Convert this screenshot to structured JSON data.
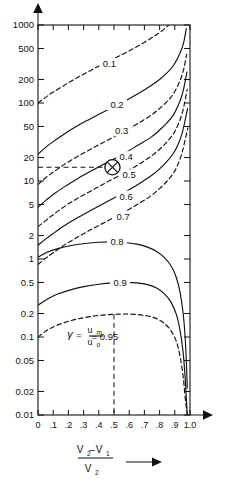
{
  "chart_data": {
    "type": "line",
    "title": "",
    "xlabel": "(V2 - V1) / V2",
    "ylabel": "",
    "xlim": [
      0,
      1.0
    ],
    "ylim": [
      0.01,
      1000
    ],
    "yscale": "log",
    "grid": false,
    "legend": "inline-curve-labels",
    "x_ticks": [
      "0",
      ".1",
      ".2",
      ".3",
      ".4",
      ".5",
      ".6",
      ".7",
      ".8",
      ".9",
      "1.0"
    ],
    "x_tick_values": [
      0,
      0.1,
      0.2,
      0.3,
      0.4,
      0.5,
      0.6,
      0.7,
      0.8,
      0.9,
      1.0
    ],
    "y_ticks": [
      "1000",
      "500",
      "200",
      "100",
      "50",
      "20",
      "10",
      "5",
      "2",
      "1",
      "0.5",
      "0.2",
      "0.1",
      "0.05",
      "0.02",
      "0.01"
    ],
    "y_tick_values": [
      1000,
      500,
      200,
      100,
      50,
      20,
      10,
      5,
      2,
      1,
      0.5,
      0.2,
      0.1,
      0.05,
      0.02,
      0.01
    ],
    "annotations": [
      {
        "name": "gamma-definition",
        "text": "= 0.95",
        "symbol": "γ",
        "numerator": "u",
        "numerator_sub": "m",
        "denominator": "u",
        "denominator_sub": "o",
        "equals": "="
      },
      {
        "name": "marker-point",
        "label": "operating-point",
        "x": 0.49,
        "y": 15,
        "on_curve": "0.4"
      },
      {
        "name": "vertical-reference",
        "x": 0.5
      }
    ],
    "series": [
      {
        "name": "0.1",
        "label": "0.1",
        "style": "dashed",
        "x": [
          0.0,
          0.05,
          0.1,
          0.18,
          0.26,
          0.34,
          0.42,
          0.5,
          0.58,
          0.66,
          0.74,
          0.8,
          0.85,
          0.89,
          0.92,
          0.945,
          0.962,
          0.972
        ],
        "values": [
          100,
          118,
          138,
          172,
          212,
          258,
          310,
          370,
          445,
          540,
          670,
          800,
          960,
          1150,
          1400,
          1750,
          2200,
          2700
        ]
      },
      {
        "name": "0.2",
        "label": "0.2",
        "style": "solid",
        "x": [
          0.0,
          0.05,
          0.1,
          0.18,
          0.26,
          0.34,
          0.42,
          0.5,
          0.58,
          0.66,
          0.74,
          0.8,
          0.85,
          0.89,
          0.92,
          0.945,
          0.962,
          0.975
        ],
        "values": [
          22,
          27,
          32,
          41,
          51,
          62,
          75,
          90,
          108,
          132,
          165,
          200,
          245,
          300,
          380,
          490,
          640,
          900
        ]
      },
      {
        "name": "0.3",
        "label": "0.3",
        "style": "dashed",
        "x": [
          0.0,
          0.05,
          0.1,
          0.18,
          0.26,
          0.34,
          0.42,
          0.5,
          0.58,
          0.66,
          0.74,
          0.8,
          0.85,
          0.89,
          0.92,
          0.945,
          0.962,
          0.978
        ],
        "values": [
          9.0,
          11.0,
          13.0,
          16.6,
          20.6,
          25.2,
          30.5,
          36.8,
          44.5,
          55,
          69,
          85,
          105,
          130,
          168,
          220,
          290,
          420
        ]
      },
      {
        "name": "0.4",
        "label": "0.4",
        "style": "solid",
        "x": [
          0.0,
          0.05,
          0.1,
          0.18,
          0.26,
          0.34,
          0.42,
          0.5,
          0.58,
          0.66,
          0.74,
          0.8,
          0.85,
          0.89,
          0.92,
          0.945,
          0.962,
          0.98
        ],
        "values": [
          4.6,
          5.6,
          6.7,
          8.6,
          10.7,
          13.1,
          15.9,
          19.2,
          23.3,
          29,
          36,
          45,
          56,
          70,
          91,
          122,
          165,
          250
        ]
      },
      {
        "name": "0.5",
        "label": "0.5",
        "style": "dashed",
        "x": [
          0.0,
          0.05,
          0.1,
          0.18,
          0.26,
          0.34,
          0.42,
          0.5,
          0.58,
          0.66,
          0.74,
          0.8,
          0.85,
          0.89,
          0.92,
          0.945,
          0.962,
          0.982
        ],
        "values": [
          2.6,
          3.1,
          3.7,
          4.8,
          6.0,
          7.3,
          8.9,
          10.8,
          13.1,
          16.2,
          20.5,
          25.5,
          32,
          40,
          52,
          70,
          95,
          150
        ]
      },
      {
        "name": "0.6",
        "label": "0.6",
        "style": "solid",
        "x": [
          0.0,
          0.05,
          0.1,
          0.18,
          0.26,
          0.34,
          0.42,
          0.5,
          0.58,
          0.66,
          0.74,
          0.8,
          0.85,
          0.89,
          0.92,
          0.945,
          0.962,
          0.984
        ],
        "values": [
          1.5,
          1.8,
          2.12,
          2.72,
          3.38,
          4.12,
          5.0,
          6.05,
          7.35,
          9.1,
          11.5,
          14.3,
          18.0,
          22.5,
          29,
          39,
          53,
          85
        ]
      },
      {
        "name": "0.7",
        "label": "0.7",
        "style": "dashed",
        "x": [
          0.0,
          0.05,
          0.1,
          0.18,
          0.26,
          0.34,
          0.42,
          0.5,
          0.58,
          0.66,
          0.74,
          0.8,
          0.85,
          0.89,
          0.92,
          0.945,
          0.962,
          0.986
        ],
        "values": [
          0.85,
          1.02,
          1.2,
          1.54,
          1.91,
          2.33,
          2.82,
          3.41,
          4.13,
          5.1,
          6.4,
          8.0,
          10.0,
          12.5,
          16.2,
          22,
          30,
          48
        ]
      },
      {
        "name": "0.8",
        "label": "0.8",
        "style": "solid",
        "x": [
          0.0,
          0.06,
          0.13,
          0.22,
          0.31,
          0.4,
          0.49,
          0.57,
          0.65,
          0.72,
          0.78,
          0.83,
          0.875,
          0.91,
          0.935,
          0.955,
          0.968,
          0.976,
          0.982
        ],
        "values": [
          1.05,
          1.22,
          1.36,
          1.49,
          1.58,
          1.64,
          1.66,
          1.63,
          1.55,
          1.42,
          1.25,
          1.05,
          0.82,
          0.58,
          0.37,
          0.2,
          0.1,
          0.048,
          0.022
        ]
      },
      {
        "name": "0.9",
        "label": "0.9",
        "style": "solid",
        "x": [
          0.0,
          0.06,
          0.13,
          0.22,
          0.31,
          0.4,
          0.49,
          0.57,
          0.65,
          0.72,
          0.78,
          0.83,
          0.875,
          0.91,
          0.935,
          0.955,
          0.968,
          0.976,
          0.982
        ],
        "values": [
          0.255,
          0.305,
          0.355,
          0.405,
          0.445,
          0.475,
          0.495,
          0.502,
          0.495,
          0.47,
          0.425,
          0.36,
          0.28,
          0.195,
          0.12,
          0.063,
          0.03,
          0.016,
          0.01
        ]
      },
      {
        "name": "0.95",
        "label": "0.95",
        "style": "dashed",
        "x": [
          0.0,
          0.06,
          0.13,
          0.22,
          0.31,
          0.4,
          0.49,
          0.57,
          0.65,
          0.72,
          0.78,
          0.83,
          0.875,
          0.91,
          0.935,
          0.955,
          0.968,
          0.976,
          0.982
        ],
        "values": [
          0.1,
          0.122,
          0.143,
          0.163,
          0.178,
          0.189,
          0.195,
          0.197,
          0.194,
          0.186,
          0.172,
          0.15,
          0.12,
          0.088,
          0.056,
          0.031,
          0.017,
          0.0125,
          0.01
        ]
      }
    ]
  },
  "axis": {
    "x_label_numerator_a": "V",
    "x_label_numerator_a_sub": "2",
    "x_label_minus": "–",
    "x_label_numerator_b": "V",
    "x_label_numerator_b_sub": "1",
    "x_label_denominator": "V",
    "x_label_denominator_sub": "2"
  }
}
